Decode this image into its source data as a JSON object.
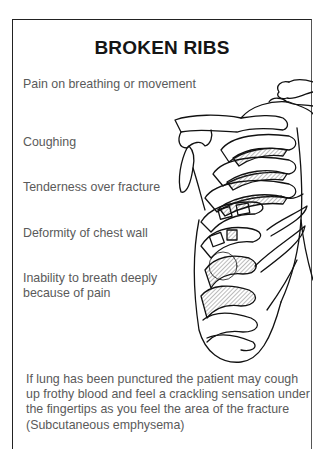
{
  "card": {
    "title": "BROKEN RIBS",
    "symptoms": [
      {
        "label": "Pain on breathing or movement"
      },
      {
        "label": "Coughing"
      },
      {
        "label": "Tenderness over fracture"
      },
      {
        "label": "Deformity of chest wall"
      },
      {
        "label": "Inability to breath deeply because of pain"
      }
    ],
    "illustration": {
      "icon": "rib-cage-skeleton-illustration"
    },
    "footer_note": "If lung has been punctured the patient may cough up frothy blood and feel a crackling sensation under the fingertips as you feel the area of the fracture (Subcutaneous emphysema)"
  },
  "colors": {
    "title": "#151515",
    "body_text": "#5a5a5a",
    "border": "#222222",
    "hatch": "#555555"
  }
}
